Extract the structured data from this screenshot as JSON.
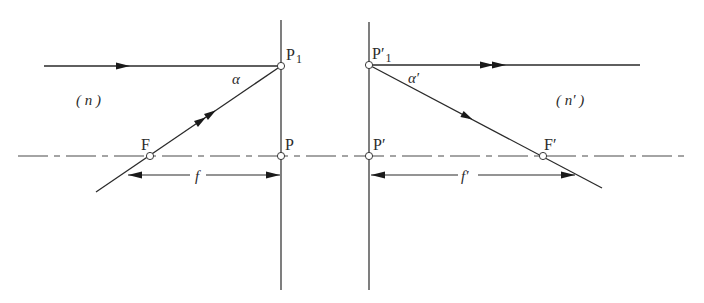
{
  "diagram": {
    "type": "optics-principal-planes",
    "colors": {
      "line": "#3a3a3a",
      "background": "#ffffff",
      "point_fill": "#ffffff"
    },
    "labels": {
      "P1": "P",
      "P1_sub": "1",
      "P1prime": "P′",
      "P1prime_sub": "1",
      "P": "P",
      "Pprime": "P′",
      "F": "F",
      "Fprime": "F′",
      "alpha": "α",
      "alphaprime": "α′",
      "medium_left": "( n )",
      "medium_right": "( n′ )",
      "f": "f",
      "fprime": "f′"
    },
    "elements": {
      "optical_axis": "dash-dot center line",
      "principal_plane_object": "vertical line through P and P1",
      "principal_plane_image": "vertical line through P' and P'1",
      "incident_ray_parallel": "horizontal ray to P1 (single arrow)",
      "ray_through_F": "ray from F to P1 (double arrow)",
      "emergent_ray_parallel": "horizontal ray from P'1 (double arrow)",
      "ray_to_Fprime": "ray from P'1 through F' (single arrow)",
      "dimension_f": "distance F to P",
      "dimension_fprime": "distance P' to F'"
    }
  }
}
